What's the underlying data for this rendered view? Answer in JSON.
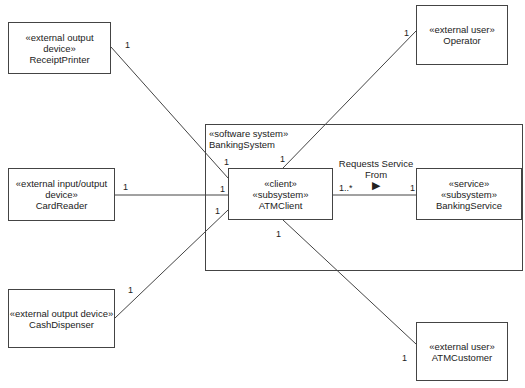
{
  "diagram": {
    "system": {
      "stereotype": "«software system»",
      "name": "BankingSystem"
    },
    "nodes": {
      "receipt_printer": {
        "stereotype": "«external output device»",
        "name": "ReceiptPrinter"
      },
      "operator": {
        "stereotype": "«external user»",
        "name": "Operator"
      },
      "card_reader": {
        "stereotype1": "«external input/output",
        "stereotype2": "device»",
        "name": "CardReader"
      },
      "cash_dispenser": {
        "stereotype": "«external output device»",
        "name": "CashDispenser"
      },
      "atm_customer": {
        "stereotype": "«external user»",
        "name": "ATMCustomer"
      },
      "atm_client": {
        "stereotype1": "«client»",
        "stereotype2": "«subsystem»",
        "name": "ATMClient"
      },
      "banking_service": {
        "stereotype1": "«service»",
        "stereotype2": "«subsystem»",
        "name": "BankingService"
      }
    },
    "association": {
      "label1": "Requests Service",
      "label2": "From",
      "direction": "▶"
    },
    "multiplicities": {
      "rp_end": "1",
      "rp_client": "1",
      "op_end": "1",
      "op_client": "1",
      "cr_end": "1",
      "cr_client": "1",
      "cd_end": "1",
      "cd_client": "1",
      "cust_end": "1",
      "cust_client": "1",
      "client_many": "1..*",
      "service_one": "1"
    }
  }
}
